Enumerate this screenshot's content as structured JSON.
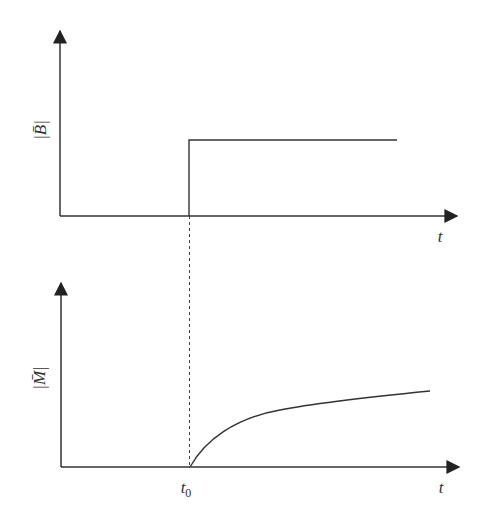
{
  "diagram": {
    "type": "step-response",
    "colors": {
      "line": "#333333",
      "dashed": "#444444",
      "background": "#ffffff"
    },
    "top_plot": {
      "y_label": "|B̄|",
      "y_label_base": "B",
      "x_label": "t",
      "description": "Step function: |B| jumps from 0 to constant at t0"
    },
    "bottom_plot": {
      "y_label": "|M̄|",
      "y_label_base": "M",
      "x_label": "t",
      "t0_label": "t",
      "t0_subscript": "0",
      "description": "|M| rises from 0 at t0, saturating curve"
    }
  }
}
